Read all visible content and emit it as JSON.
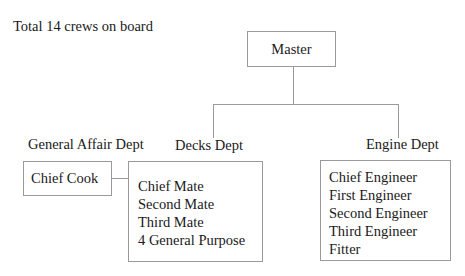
{
  "summary": "Total 14 crews on board",
  "root": {
    "label": "Master"
  },
  "departments": [
    {
      "name": "General Affair Dept",
      "members": [
        "Chief Cook"
      ]
    },
    {
      "name": "Decks Dept",
      "members": [
        "Chief Mate",
        "Second Mate",
        "Third Mate",
        "4 General Purpose"
      ]
    },
    {
      "name": "Engine Dept",
      "members": [
        "Chief Engineer",
        "First Engineer",
        "Second Engineer",
        "Third Engineer",
        "Fitter"
      ]
    }
  ],
  "colors": {
    "line": "#9a9a9a",
    "text": "#1a1a1a",
    "background": "#ffffff"
  }
}
